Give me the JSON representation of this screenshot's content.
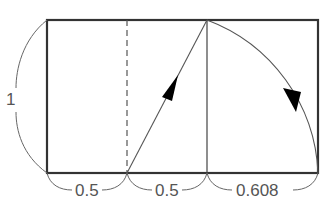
{
  "diagram": {
    "labels": {
      "height": "1",
      "segment_1": "0.5",
      "segment_2": "0.5",
      "segment_3": "0.608"
    },
    "colors": {
      "stroke": "#333333",
      "thin": "#666666",
      "text": "#555555"
    }
  }
}
